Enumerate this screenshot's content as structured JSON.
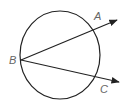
{
  "diagram": {
    "type": "geometry",
    "colors": {
      "stroke": "#222222",
      "label": "#666666",
      "background": "#ffffff"
    },
    "circle": {
      "cx": 60,
      "cy": 55,
      "rx": 40,
      "ry": 44
    },
    "points": [
      {
        "id": "B",
        "label": "B",
        "x": 21,
        "y": 60,
        "label_x": 9,
        "label_y": 64
      },
      {
        "id": "A",
        "label": "A",
        "label_x": 94,
        "label_y": 20
      },
      {
        "id": "C",
        "label": "C",
        "label_x": 100,
        "label_y": 93
      }
    ],
    "rays": [
      {
        "name": "ray-BA",
        "from": "B",
        "through": "A",
        "x1": 21,
        "y1": 60,
        "x2": 117,
        "y2": 20
      },
      {
        "name": "ray-BC",
        "from": "B",
        "through": "C",
        "x1": 21,
        "y1": 60,
        "x2": 119,
        "y2": 82
      }
    ]
  }
}
